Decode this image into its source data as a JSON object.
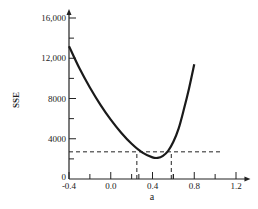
{
  "chart_data": {
    "type": "line",
    "title": "",
    "xlabel": "a",
    "ylabel": "SSE",
    "xlim": [
      -0.4,
      1.3
    ],
    "ylim": [
      0,
      16500
    ],
    "x_ticks": [
      -0.4,
      0.0,
      0.4,
      0.8,
      1.2
    ],
    "x_tick_labels": [
      "-0.4",
      "0.0",
      "0.4",
      "0.8",
      "1.2"
    ],
    "x_minor_ticks": [
      -0.2,
      0.2,
      0.6,
      1.0
    ],
    "y_ticks": [
      0,
      4000,
      8000,
      12000,
      16000
    ],
    "y_tick_labels": [
      "0",
      "4000",
      "8000",
      "12,000",
      "16,000"
    ],
    "y_minor_ticks": [
      2000,
      6000,
      10000,
      14000
    ],
    "grid": false,
    "legend": null,
    "series": [
      {
        "name": "SSE curve",
        "x": [
          -0.4,
          -0.3,
          -0.2,
          -0.1,
          0.0,
          0.1,
          0.2,
          0.3,
          0.4,
          0.45,
          0.5,
          0.55,
          0.6,
          0.65,
          0.7,
          0.75,
          0.8
        ],
        "values": [
          13200,
          11000,
          9100,
          7400,
          5900,
          4600,
          3500,
          2650,
          2150,
          2100,
          2300,
          2800,
          3700,
          5000,
          6900,
          9000,
          11400
        ]
      }
    ],
    "annotations": [
      {
        "type": "hline",
        "y": 2700,
        "x_from": -0.4,
        "x_to": 1.07,
        "style": "dashed"
      },
      {
        "type": "vline",
        "x": 0.25,
        "y_from": 0,
        "y_to": 2700,
        "style": "dashed"
      },
      {
        "type": "vline",
        "x": 0.58,
        "y_from": 0,
        "y_to": 2700,
        "style": "dashed"
      }
    ]
  },
  "labels": {
    "xlabel": "a",
    "ylabel": "SSE"
  }
}
